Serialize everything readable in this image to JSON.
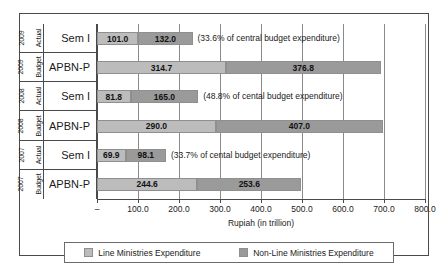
{
  "chart_data": {
    "type": "bar",
    "orientation": "horizontal",
    "stacked": true,
    "title": "",
    "xlabel": "Rupiah (in trillion)",
    "ylabel": "",
    "xlim": [
      0,
      800
    ],
    "xticks": [
      "–",
      "100.0",
      "200.0",
      "300.0",
      "400.0",
      "500.0",
      "600.0",
      "700.0",
      "800.0"
    ],
    "xtick_values": [
      0,
      100,
      200,
      300,
      400,
      500,
      600,
      700,
      800
    ],
    "grid": true,
    "legend_position": "bottom",
    "legend": [
      {
        "name": "Line Ministries Expenditure",
        "color": "#bcbcbc"
      },
      {
        "name": "Non-Line Ministries Expenditure",
        "color": "#9a9a9a"
      }
    ],
    "categories": [
      {
        "year": "2009",
        "kind": "Actual",
        "label": "Sem I"
      },
      {
        "year": "2009",
        "kind": "Budget",
        "label": "APBN-P"
      },
      {
        "year": "2008",
        "kind": "Actual",
        "label": "Sem I"
      },
      {
        "year": "2008",
        "kind": "Budget",
        "label": "APBN-P"
      },
      {
        "year": "2007",
        "kind": "Actual",
        "label": "Sem I"
      },
      {
        "year": "2007",
        "kind": "Budget",
        "label": "APBN-P"
      }
    ],
    "series": [
      {
        "name": "Line Ministries Expenditure",
        "values": [
          101.0,
          314.7,
          81.8,
          290.0,
          69.9,
          244.6
        ]
      },
      {
        "name": "Non-Line Ministries Expenditure",
        "values": [
          132.0,
          376.8,
          165.0,
          407.0,
          98.1,
          253.6
        ]
      }
    ],
    "value_labels": [
      [
        "101.0",
        "132.0"
      ],
      [
        "314.7",
        "376.8"
      ],
      [
        "81.8",
        "165.0"
      ],
      [
        "290.0",
        "407.0"
      ],
      [
        "69.9",
        "98.1"
      ],
      [
        "244.6",
        "253.6"
      ]
    ],
    "annotations": [
      "(33.6% of  central budget expenditure)",
      "",
      "(48.8% of cental budget expenditure)",
      "",
      "(33.7% of cental budget expenditure)",
      ""
    ]
  }
}
